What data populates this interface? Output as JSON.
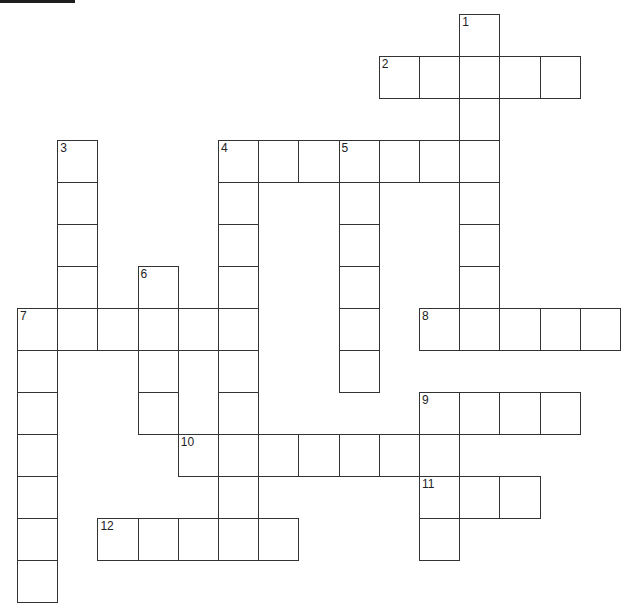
{
  "puzzle": {
    "type": "crossword",
    "cell_size_px": {
      "w": 40.2,
      "h": 42
    },
    "origin_px": {
      "x": 17,
      "y": 14
    },
    "colors": {
      "line": "#333333",
      "background": "#ffffff",
      "number": "#222222",
      "top_bar": "#1e1e1e"
    },
    "entries": [
      {
        "number": "1",
        "direction": "down",
        "row": 0,
        "col": 11,
        "length": 8
      },
      {
        "number": "2",
        "direction": "across",
        "row": 1,
        "col": 9,
        "length": 5
      },
      {
        "number": "3",
        "direction": "down",
        "row": 3,
        "col": 1,
        "length": 5
      },
      {
        "number": "4",
        "direction": "across",
        "row": 3,
        "col": 5,
        "length": 7
      },
      {
        "number": "4",
        "direction": "down",
        "row": 3,
        "col": 5,
        "length": 9
      },
      {
        "number": "5",
        "direction": "down",
        "row": 3,
        "col": 8,
        "length": 6
      },
      {
        "number": "6",
        "direction": "down",
        "row": 6,
        "col": 3,
        "length": 4
      },
      {
        "number": "7",
        "direction": "across",
        "row": 7,
        "col": 0,
        "length": 6
      },
      {
        "number": "7",
        "direction": "down",
        "row": 7,
        "col": 0,
        "length": 7
      },
      {
        "number": "8",
        "direction": "across",
        "row": 7,
        "col": 10,
        "length": 5
      },
      {
        "number": "9",
        "direction": "across",
        "row": 9,
        "col": 10,
        "length": 4
      },
      {
        "number": "9",
        "direction": "down",
        "row": 9,
        "col": 10,
        "length": 4
      },
      {
        "number": "10",
        "direction": "across",
        "row": 10,
        "col": 4,
        "length": 7
      },
      {
        "number": "11",
        "direction": "across",
        "row": 11,
        "col": 10,
        "length": 3
      },
      {
        "number": "12",
        "direction": "across",
        "row": 12,
        "col": 2,
        "length": 5
      }
    ],
    "numbers": [
      {
        "label": "1",
        "row": 0,
        "col": 11
      },
      {
        "label": "2",
        "row": 1,
        "col": 9
      },
      {
        "label": "3",
        "row": 3,
        "col": 1
      },
      {
        "label": "4",
        "row": 3,
        "col": 5
      },
      {
        "label": "5",
        "row": 3,
        "col": 8
      },
      {
        "label": "6",
        "row": 6,
        "col": 3
      },
      {
        "label": "7",
        "row": 7,
        "col": 0
      },
      {
        "label": "8",
        "row": 7,
        "col": 10
      },
      {
        "label": "9",
        "row": 9,
        "col": 10
      },
      {
        "label": "10",
        "row": 10,
        "col": 4
      },
      {
        "label": "11",
        "row": 11,
        "col": 10
      },
      {
        "label": "12",
        "row": 12,
        "col": 2
      }
    ]
  }
}
